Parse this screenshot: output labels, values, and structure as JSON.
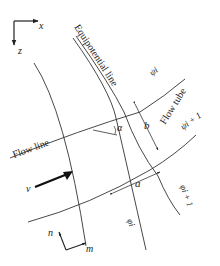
{
  "diagram": {
    "type": "flow net (streamlines and equipotential lines)",
    "axes_top": {
      "x_label": "x",
      "z_label": "z"
    },
    "axes_bottom": {
      "n_label": "n",
      "m_label": "m"
    },
    "labels": {
      "equipotential_line": "Equipotential line",
      "flow_tube": "Flow tube",
      "flow_line": "Flow line",
      "psi_i": "ψi",
      "psi_i_plus_1": "ψi + 1",
      "phi_i": "φi",
      "phi_i_plus_1": "φi + 1",
      "alpha": "α",
      "a": "a",
      "b": "b",
      "velocity": "v"
    },
    "colors": {
      "line": "#333333",
      "background": "#ffffff"
    }
  }
}
